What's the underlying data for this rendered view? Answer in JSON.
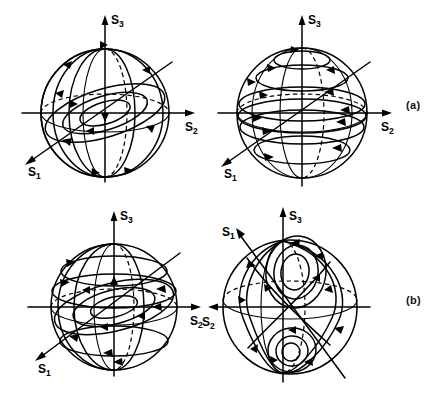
{
  "figure": {
    "type": "scientific-line-figure",
    "background_color": "#ffffff",
    "line_color": "#000000",
    "rows": 2,
    "columns": 2
  },
  "panels": [
    {
      "id": "a",
      "label": "(a)",
      "spheres": [
        {
          "position": "top-left",
          "axes": [
            {
              "name": "S3",
              "base": "S",
              "sub": "3",
              "direction": "up"
            },
            {
              "name": "S2",
              "base": "S",
              "sub": "2",
              "direction": "right"
            },
            {
              "name": "S1",
              "base": "S",
              "sub": "1",
              "direction": "down-left"
            }
          ],
          "flow": "meridional trajectories converging on the S3 poles; closed loops about the S1 axis",
          "fixed_points": [
            "north pole",
            "south pole"
          ]
        },
        {
          "position": "top-right",
          "axes": [
            {
              "name": "S3",
              "base": "S",
              "sub": "3",
              "direction": "up"
            },
            {
              "name": "S2",
              "base": "S",
              "sub": "2",
              "direction": "right"
            },
            {
              "name": "S1",
              "base": "S",
              "sub": "1",
              "direction": "down-left"
            }
          ],
          "flow": "latitude circles traversed azimuthally; flow crowds toward the equator",
          "fixed_points": [
            "north pole",
            "south pole"
          ]
        }
      ]
    },
    {
      "id": "b",
      "label": "(b)",
      "spheres": [
        {
          "position": "bottom-left",
          "axes": [
            {
              "name": "S3",
              "base": "S",
              "sub": "3",
              "direction": "up"
            },
            {
              "name": "S2",
              "base": "S",
              "sub": "2",
              "direction": "right"
            },
            {
              "name": "S1",
              "base": "S",
              "sub": "1",
              "direction": "down-left"
            }
          ],
          "flow": "tilted latitude circles plus meridional arcs spiralling to the poles",
          "fixed_points": [
            "north pole",
            "south pole"
          ]
        },
        {
          "position": "bottom-right",
          "axes": [
            {
              "name": "S3",
              "base": "S",
              "sub": "3",
              "direction": "up"
            },
            {
              "name": "S2",
              "base": "S",
              "sub": "2",
              "direction": "left"
            },
            {
              "name": "S1",
              "base": "S",
              "sub": "1",
              "direction": "up-left"
            }
          ],
          "flow": "double spiral: nested loops about an upper focus and a lower focus joined by a saddle connection",
          "fixed_points": [
            "upper focus",
            "lower focus",
            "saddle"
          ]
        }
      ]
    }
  ]
}
